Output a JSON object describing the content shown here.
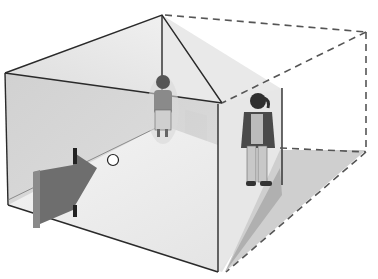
{
  "figure": {
    "colors": {
      "background": "#ffffff",
      "left_wall": "#d2d2d2",
      "back_wall": "#e6e6e6",
      "floor": "#ececec",
      "ceiling": "#efefef",
      "right_wall": "#e4e4e4",
      "shadow": "#c4c4c4",
      "arrow": "#6f6f6f",
      "outline": "#2a2a2a",
      "dashed_outline": "#555555",
      "figure_dark": "#3c3c3c"
    },
    "elements": {
      "arrow": "viewing-direction-arrow",
      "peephole": "peephole-circle",
      "person_left": "small-appearing-person",
      "person_right": "large-appearing-person",
      "dashed_box": "apparent-room-outline"
    }
  }
}
